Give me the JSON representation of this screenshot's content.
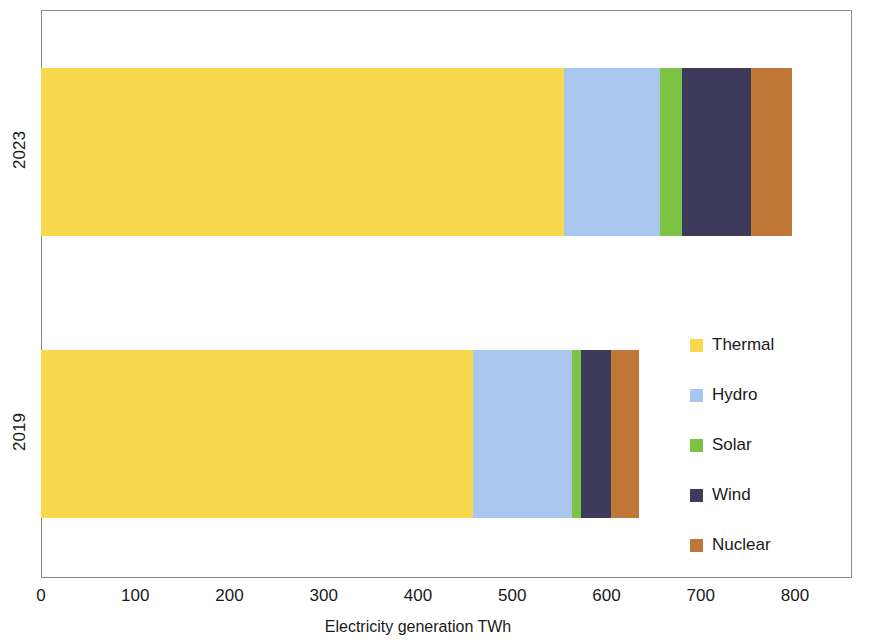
{
  "chart_data": {
    "type": "bar",
    "orientation": "horizontal",
    "stacked": true,
    "title": "",
    "xlabel": "Electricity generation TWh",
    "ylabel": "",
    "xlim": [
      0,
      800
    ],
    "xticks": [
      0,
      100,
      200,
      300,
      400,
      500,
      600,
      700,
      800
    ],
    "xtick_labels": [
      "0",
      "100",
      "200",
      "300",
      "400",
      "500",
      "600",
      "700",
      "800"
    ],
    "categories": [
      "2023",
      "2019"
    ],
    "grid": false,
    "legend_position": "right",
    "series": [
      {
        "name": "Thermal",
        "color": "#F8D84C",
        "values": [
          555,
          458
        ]
      },
      {
        "name": "Hydro",
        "color": "#A8C6EE",
        "values": [
          102,
          105
        ]
      },
      {
        "name": "Solar",
        "color": "#7DC242",
        "values": [
          23,
          10
        ]
      },
      {
        "name": "Wind",
        "color": "#3D3A5C",
        "values": [
          73,
          32
        ]
      },
      {
        "name": "Nuclear",
        "color": "#C07838",
        "values": [
          44,
          29
        ]
      }
    ],
    "totals": [
      797,
      634
    ]
  },
  "axis": {
    "x_title": "Electricity generation TWh",
    "x_tick_labels": [
      "0",
      "100",
      "200",
      "300",
      "400",
      "500",
      "600",
      "700",
      "800"
    ],
    "y_tick_labels": [
      "2023",
      "2019"
    ]
  },
  "legend": {
    "items": [
      {
        "label": "Thermal",
        "color": "#F8D84C"
      },
      {
        "label": "Hydro",
        "color": "#A8C6EE"
      },
      {
        "label": "Solar",
        "color": "#7DC242"
      },
      {
        "label": "Wind",
        "color": "#3D3A5C"
      },
      {
        "label": "Nuclear",
        "color": "#C07838"
      }
    ]
  },
  "layout": {
    "plot_left_px": 41,
    "plot_right_px": 795,
    "px_per_unit": 0.9425,
    "rows": [
      {
        "category": "2023",
        "top_px": 68,
        "label_center_px": 152
      },
      {
        "category": "2019",
        "top_px": 350,
        "label_center_px": 434
      }
    ]
  }
}
